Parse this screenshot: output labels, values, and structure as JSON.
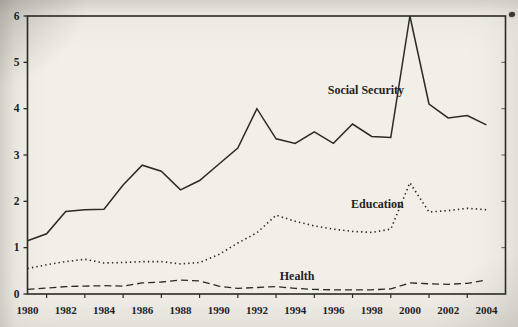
{
  "page": {
    "paper_color": "#f1efe8",
    "ink_color": "#2b2a25"
  },
  "chart_data": {
    "type": "line",
    "title": "",
    "xlabel": "",
    "ylabel": "",
    "xlim": [
      1980,
      2005
    ],
    "ylim": [
      0,
      6
    ],
    "grid": false,
    "legend_position": "inline-labels-on-plot",
    "x": [
      1980,
      1981,
      1982,
      1983,
      1984,
      1985,
      1986,
      1987,
      1988,
      1989,
      1990,
      1991,
      1992,
      1993,
      1994,
      1995,
      1996,
      1997,
      1998,
      1999,
      2000,
      2001,
      2002,
      2003,
      2004
    ],
    "x_tick_label_years": [
      1980,
      1982,
      1984,
      1986,
      1988,
      1990,
      1992,
      1994,
      1996,
      1998,
      2000,
      2002,
      2004
    ],
    "x_tick_labels": [
      "1980",
      "1982",
      "1984",
      "1986",
      "1988",
      "1990",
      "1992",
      "1994",
      "1996",
      "1998",
      "2000",
      "2002",
      "2004"
    ],
    "x_minor_tick_years": [
      1981,
      1983,
      1985,
      1987,
      1989,
      1991,
      1993,
      1995,
      1997,
      1999,
      2001,
      2003
    ],
    "y_ticks": [
      0,
      1,
      2,
      3,
      4,
      5,
      6
    ],
    "y_tick_labels": [
      "0",
      "1",
      "2",
      "3",
      "4",
      "5",
      "6"
    ],
    "series": [
      {
        "name": "Social Security",
        "style": "solid",
        "values": [
          1.15,
          1.3,
          1.78,
          1.82,
          1.83,
          2.35,
          2.78,
          2.65,
          2.25,
          2.45,
          2.8,
          3.15,
          4.0,
          3.35,
          3.25,
          3.5,
          3.25,
          3.67,
          3.4,
          3.38,
          6.0,
          4.1,
          3.8,
          3.85,
          3.65
        ]
      },
      {
        "name": "Education",
        "style": "dotted",
        "values": [
          0.55,
          0.63,
          0.7,
          0.75,
          0.67,
          0.68,
          0.7,
          0.7,
          0.65,
          0.68,
          0.85,
          1.1,
          1.32,
          1.7,
          1.57,
          1.47,
          1.4,
          1.35,
          1.33,
          1.4,
          2.4,
          1.77,
          1.8,
          1.85,
          1.82
        ]
      },
      {
        "name": "Health",
        "style": "dashed",
        "values": [
          0.1,
          0.13,
          0.16,
          0.17,
          0.18,
          0.17,
          0.24,
          0.26,
          0.3,
          0.28,
          0.17,
          0.12,
          0.14,
          0.16,
          0.12,
          0.1,
          0.09,
          0.09,
          0.09,
          0.11,
          0.24,
          0.22,
          0.21,
          0.23,
          0.3
        ]
      }
    ],
    "annotations": [
      {
        "text": "Social Security",
        "x": 1997.7,
        "y": 4.4
      },
      {
        "text": "Education",
        "x": 1998.3,
        "y": 1.95
      },
      {
        "text": "Health",
        "x": 1994.1,
        "y": 0.38
      }
    ]
  }
}
